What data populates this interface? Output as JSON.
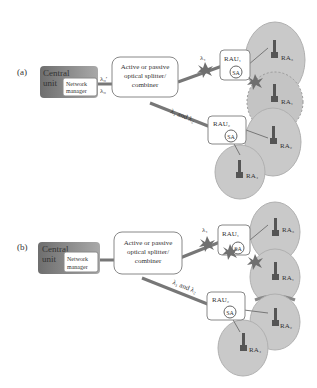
{
  "panels": [
    {
      "label": "(a)",
      "central_unit": "Central unit",
      "network_manager": [
        "Network",
        "manager"
      ],
      "lambda_top": "λ₀′",
      "lambda_bottom": "λ₀",
      "splitter": [
        "Active or passive",
        "optical splitter/",
        "combiner"
      ],
      "link1_label": "λ₁",
      "link2_label": "λ₁ and λ₂",
      "rau1": "RAU₁",
      "rau2": "RAU₂",
      "sa": "SA",
      "ra": [
        "RA₃",
        "RA₁",
        "RA₂",
        "RA₄"
      ]
    },
    {
      "label": "(b)",
      "central_unit": "Central unit",
      "network_manager": [
        "Network",
        "manager"
      ],
      "splitter": [
        "Active or passive",
        "optical splitter/",
        "combiner"
      ],
      "link1_label": "λ₁",
      "link2_label": "λ₁ and λ₂",
      "rau1": "RAU₁",
      "rau2": "RAU₂",
      "sa": "SA",
      "ra": [
        "RA₃",
        "RA₁",
        "RA₂",
        "RA₄"
      ]
    }
  ],
  "colors": {
    "central_unit": "#8a8a8a",
    "cell": "#c9c9c9",
    "failure": "#6f6f6f",
    "line": "#777777"
  }
}
